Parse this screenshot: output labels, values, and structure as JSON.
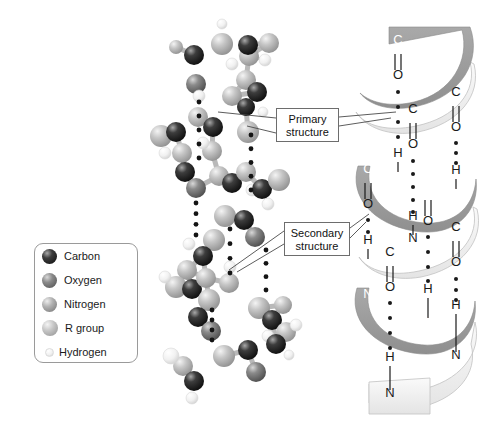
{
  "figure": {
    "background_color": "#ffffff",
    "title": ""
  },
  "legend": {
    "name": "atom-key",
    "items": [
      {
        "label": "Carbon",
        "color": "#1e1e1e",
        "highlight": "#8d8d8d",
        "size": 15
      },
      {
        "label": "Oxygen",
        "color": "#6f6f6f",
        "highlight": "#c9c9c9",
        "size": 15
      },
      {
        "label": "Nitrogen",
        "color": "#949494",
        "highlight": "#e0e0e0",
        "size": 15
      },
      {
        "label": "R group",
        "color": "#b0b0b0",
        "highlight": "#ececec",
        "size": 16
      },
      {
        "label": "Hydrogen",
        "color": "#e6e6e6",
        "highlight": "#fbfbfb",
        "size": 9
      }
    ]
  },
  "callouts": [
    {
      "name": "primary-structure",
      "line1": "Primary",
      "line2": "structure"
    },
    {
      "name": "secondary-structure",
      "line1": "Secondary",
      "line2": "structure"
    }
  ],
  "helix": {
    "name": "alpha-helix-ribbon",
    "ribbon_front_color": "#9d9d9d",
    "ribbon_back_color": "#f2f2f2",
    "ribbon_edge_color": "#b4b4b4",
    "backbone_atom_labels": [
      {
        "text": "C",
        "x": 398,
        "y": 44,
        "color": "#ffffff"
      },
      {
        "text": "O",
        "x": 398,
        "y": 79,
        "color": "#1a1a1a"
      },
      {
        "text": "C",
        "x": 456,
        "y": 96,
        "color": "#1a1a1a"
      },
      {
        "text": "O",
        "x": 456,
        "y": 131,
        "color": "#1a1a1a"
      },
      {
        "text": "C",
        "x": 413,
        "y": 113,
        "color": "#1a1a1a"
      },
      {
        "text": "O",
        "x": 413,
        "y": 148,
        "color": "#1a1a1a"
      },
      {
        "text": "H",
        "x": 398,
        "y": 157,
        "color": "#1a1a1a"
      },
      {
        "text": "N",
        "x": 398,
        "y": 179,
        "color": "#ffffff"
      },
      {
        "text": "H",
        "x": 456,
        "y": 174,
        "color": "#1a1a1a"
      },
      {
        "text": "N",
        "x": 456,
        "y": 196,
        "color": "#ffffff"
      },
      {
        "text": "C",
        "x": 428,
        "y": 190,
        "color": "#ffffff"
      },
      {
        "text": "O",
        "x": 428,
        "y": 225,
        "color": "#1a1a1a"
      },
      {
        "text": "C",
        "x": 368,
        "y": 173,
        "color": "#ffffff"
      },
      {
        "text": "O",
        "x": 368,
        "y": 208,
        "color": "#1a1a1a"
      },
      {
        "text": "H",
        "x": 413,
        "y": 220,
        "color": "#1a1a1a"
      },
      {
        "text": "N",
        "x": 413,
        "y": 242,
        "color": "#1a1a1a"
      },
      {
        "text": "C",
        "x": 456,
        "y": 231,
        "color": "#1a1a1a"
      },
      {
        "text": "O",
        "x": 456,
        "y": 266,
        "color": "#1a1a1a"
      },
      {
        "text": "H",
        "x": 368,
        "y": 244,
        "color": "#1a1a1a"
      },
      {
        "text": "C",
        "x": 390,
        "y": 256,
        "color": "#1a1a1a"
      },
      {
        "text": "O",
        "x": 390,
        "y": 291,
        "color": "#1a1a1a"
      },
      {
        "text": "N",
        "x": 368,
        "y": 298,
        "color": "#ffffff"
      },
      {
        "text": "H",
        "x": 428,
        "y": 293,
        "color": "#1a1a1a"
      },
      {
        "text": "N",
        "x": 428,
        "y": 325,
        "color": "#ffffff"
      },
      {
        "text": "H",
        "x": 456,
        "y": 309,
        "color": "#1a1a1a"
      },
      {
        "text": "N",
        "x": 456,
        "y": 359,
        "color": "#1a1a1a"
      },
      {
        "text": "H",
        "x": 390,
        "y": 361,
        "color": "#1a1a1a"
      },
      {
        "text": "N",
        "x": 390,
        "y": 397,
        "color": "#1a1a1a"
      }
    ],
    "hydrogen_bond_dot_columns": [
      {
        "x": 398,
        "y_start": 90,
        "y_end": 148,
        "count": 3
      },
      {
        "x": 456,
        "y_start": 142,
        "y_end": 166,
        "count": 3
      },
      {
        "x": 413,
        "y_start": 160,
        "y_end": 212,
        "count": 4
      },
      {
        "x": 428,
        "y_start": 236,
        "y_end": 284,
        "count": 3
      },
      {
        "x": 456,
        "y_start": 278,
        "y_end": 302,
        "count": 3
      },
      {
        "x": 368,
        "y_start": 219,
        "y_end": 236,
        "count": 2
      },
      {
        "x": 390,
        "y_start": 302,
        "y_end": 352,
        "count": 4
      }
    ]
  },
  "molecule": {
    "name": "ball-and-stick-polypeptide",
    "description": "Ball-and-stick model of a polypeptide backbone coiled into a helix",
    "hydrogen_bond_dot_columns": [
      {
        "x": 199,
        "y_start": 102,
        "y_end": 158,
        "count": 5
      },
      {
        "x": 251,
        "y_start": 135,
        "y_end": 190,
        "count": 5
      },
      {
        "x": 196,
        "y_start": 203,
        "y_end": 235,
        "count": 4
      },
      {
        "x": 230,
        "y_start": 229,
        "y_end": 273,
        "count": 4
      },
      {
        "x": 266,
        "y_start": 250,
        "y_end": 290,
        "count": 4
      },
      {
        "x": 212,
        "y_start": 310,
        "y_end": 340,
        "count": 4
      }
    ],
    "atoms": [
      {
        "x": 222,
        "y": 44,
        "r": 11,
        "t": "R"
      },
      {
        "x": 194,
        "y": 55,
        "r": 10,
        "t": "C"
      },
      {
        "x": 196,
        "y": 84,
        "r": 10,
        "t": "O"
      },
      {
        "x": 176,
        "y": 47,
        "r": 7,
        "t": "R"
      },
      {
        "x": 222,
        "y": 24,
        "r": 5,
        "t": "H"
      },
      {
        "x": 249,
        "y": 56,
        "r": 10,
        "t": "R"
      },
      {
        "x": 232,
        "y": 64,
        "r": 6,
        "t": "H"
      },
      {
        "x": 248,
        "y": 45,
        "r": 10,
        "t": "C"
      },
      {
        "x": 269,
        "y": 43,
        "r": 10,
        "t": "R"
      },
      {
        "x": 265,
        "y": 60,
        "r": 6,
        "t": "H"
      },
      {
        "x": 246,
        "y": 80,
        "r": 10,
        "t": "R"
      },
      {
        "x": 257,
        "y": 92,
        "r": 10,
        "t": "C"
      },
      {
        "x": 232,
        "y": 96,
        "r": 10,
        "t": "R"
      },
      {
        "x": 246,
        "y": 107,
        "r": 9,
        "t": "C"
      },
      {
        "x": 263,
        "y": 112,
        "r": 5,
        "t": "H"
      },
      {
        "x": 198,
        "y": 117,
        "r": 10,
        "t": "R"
      },
      {
        "x": 199,
        "y": 96,
        "r": 6,
        "t": "H"
      },
      {
        "x": 213,
        "y": 127,
        "r": 10,
        "t": "C"
      },
      {
        "x": 248,
        "y": 132,
        "r": 11,
        "t": "R"
      },
      {
        "x": 161,
        "y": 136,
        "r": 11,
        "t": "R"
      },
      {
        "x": 176,
        "y": 132,
        "r": 10,
        "t": "C"
      },
      {
        "x": 165,
        "y": 153,
        "r": 6,
        "t": "H"
      },
      {
        "x": 182,
        "y": 153,
        "r": 10,
        "t": "R"
      },
      {
        "x": 212,
        "y": 151,
        "r": 10,
        "t": "R"
      },
      {
        "x": 203,
        "y": 143,
        "r": 6,
        "t": "H"
      },
      {
        "x": 185,
        "y": 172,
        "r": 10,
        "t": "C"
      },
      {
        "x": 196,
        "y": 188,
        "r": 10,
        "t": "O"
      },
      {
        "x": 219,
        "y": 176,
        "r": 10,
        "t": "R"
      },
      {
        "x": 232,
        "y": 183,
        "r": 10,
        "t": "C"
      },
      {
        "x": 246,
        "y": 172,
        "r": 10,
        "t": "R"
      },
      {
        "x": 252,
        "y": 190,
        "r": 6,
        "t": "H"
      },
      {
        "x": 262,
        "y": 189,
        "r": 10,
        "t": "C"
      },
      {
        "x": 279,
        "y": 180,
        "r": 11,
        "t": "R"
      },
      {
        "x": 268,
        "y": 204,
        "r": 6,
        "t": "H"
      },
      {
        "x": 225,
        "y": 216,
        "r": 11,
        "t": "R"
      },
      {
        "x": 244,
        "y": 220,
        "r": 10,
        "t": "C"
      },
      {
        "x": 255,
        "y": 237,
        "r": 10,
        "t": "O"
      },
      {
        "x": 214,
        "y": 240,
        "r": 11,
        "t": "R"
      },
      {
        "x": 203,
        "y": 256,
        "r": 10,
        "t": "C"
      },
      {
        "x": 189,
        "y": 244,
        "r": 6,
        "t": "H"
      },
      {
        "x": 187,
        "y": 270,
        "r": 10,
        "t": "R"
      },
      {
        "x": 176,
        "y": 287,
        "r": 11,
        "t": "R"
      },
      {
        "x": 192,
        "y": 289,
        "r": 10,
        "t": "C"
      },
      {
        "x": 165,
        "y": 277,
        "r": 6,
        "t": "H"
      },
      {
        "x": 206,
        "y": 278,
        "r": 10,
        "t": "R"
      },
      {
        "x": 230,
        "y": 267,
        "r": 6,
        "t": "H"
      },
      {
        "x": 229,
        "y": 283,
        "r": 10,
        "t": "R"
      },
      {
        "x": 209,
        "y": 300,
        "r": 11,
        "t": "R"
      },
      {
        "x": 198,
        "y": 317,
        "r": 10,
        "t": "C"
      },
      {
        "x": 211,
        "y": 331,
        "r": 10,
        "t": "O"
      },
      {
        "x": 259,
        "y": 308,
        "r": 11,
        "t": "R"
      },
      {
        "x": 272,
        "y": 320,
        "r": 10,
        "t": "C"
      },
      {
        "x": 283,
        "y": 305,
        "r": 9,
        "t": "R"
      },
      {
        "x": 286,
        "y": 332,
        "r": 10,
        "t": "R"
      },
      {
        "x": 268,
        "y": 336,
        "r": 6,
        "t": "H"
      },
      {
        "x": 296,
        "y": 325,
        "r": 6,
        "t": "H"
      },
      {
        "x": 224,
        "y": 356,
        "r": 11,
        "t": "R"
      },
      {
        "x": 248,
        "y": 350,
        "r": 10,
        "t": "C"
      },
      {
        "x": 256,
        "y": 372,
        "r": 10,
        "t": "O"
      },
      {
        "x": 183,
        "y": 366,
        "r": 10,
        "t": "R"
      },
      {
        "x": 171,
        "y": 356,
        "r": 8,
        "t": "H"
      },
      {
        "x": 194,
        "y": 381,
        "r": 10,
        "t": "C"
      },
      {
        "x": 192,
        "y": 398,
        "r": 6,
        "t": "H"
      },
      {
        "x": 276,
        "y": 344,
        "r": 10,
        "t": "C"
      },
      {
        "x": 289,
        "y": 355,
        "r": 5,
        "t": "H"
      }
    ]
  }
}
